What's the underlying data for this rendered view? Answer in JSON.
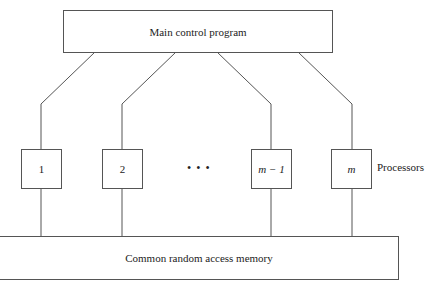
{
  "diagram": {
    "control": {
      "label": "Main control program"
    },
    "processors": [
      {
        "label": "1"
      },
      {
        "label": "2"
      },
      {
        "label": "m − 1"
      },
      {
        "label": "m"
      }
    ],
    "ellipsis": "• • •",
    "processors_label": "Processors",
    "memory": {
      "label": "Common random access memory"
    },
    "colors": {
      "stroke": "#555555",
      "background": "#ffffff",
      "text": "#222222"
    }
  }
}
